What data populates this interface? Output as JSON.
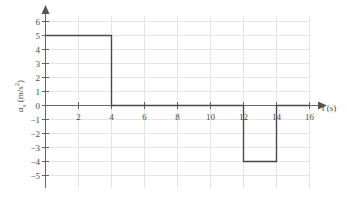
{
  "chart_data": {
    "type": "line",
    "title": "",
    "subtitle": "",
    "xlabel": "t (s)",
    "ylabel": "a_x (m/s^2)",
    "xlabel_parts": {
      "variable": "t",
      "units": "(s)"
    },
    "ylabel_parts": {
      "variable": "a",
      "subscript": "x",
      "units_open": "(m/s",
      "exponent": "2",
      "units_close": ")"
    },
    "xlim": [
      0,
      16
    ],
    "ylim": [
      -5,
      6
    ],
    "xticks": [
      2,
      4,
      6,
      8,
      10,
      12,
      14,
      16
    ],
    "xtick_labels": [
      "2",
      "4",
      "6",
      "8",
      "10",
      "12",
      "14",
      "16"
    ],
    "yticks": [
      6,
      5,
      4,
      3,
      2,
      1,
      0,
      -1,
      -2,
      -3,
      -4,
      -5
    ],
    "ytick_labels": [
      "6",
      "5",
      "4",
      "3",
      "2",
      "1",
      "0",
      "−1",
      "−2",
      "−3",
      "−4",
      "−5"
    ],
    "grid": true,
    "grid_color": "#e2e2e6",
    "legend": null,
    "line_color": "#4a4a4a",
    "axis_color": "#555555",
    "background_color": "#ffffff",
    "x": [
      0,
      4,
      4,
      12,
      12,
      14,
      14,
      16
    ],
    "y": [
      5,
      5,
      0,
      0,
      -4,
      -4,
      0,
      0
    ],
    "segments": [
      {
        "t_start": 0,
        "t_end": 4,
        "value": 5
      },
      {
        "t_start": 4,
        "t_end": 12,
        "value": 0
      },
      {
        "t_start": 12,
        "t_end": 14,
        "value": -4
      },
      {
        "t_start": 14,
        "t_end": 16,
        "value": 0
      }
    ]
  }
}
